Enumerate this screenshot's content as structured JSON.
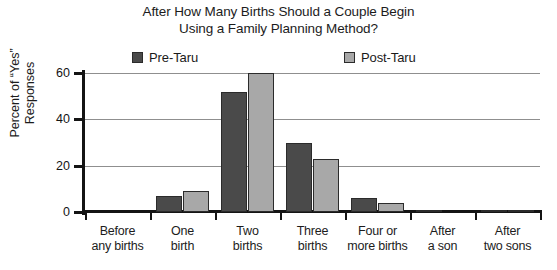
{
  "chart_data": {
    "type": "bar",
    "title": "After How Many Births Should a Couple Begin Using a Family Planning Method?",
    "title_lines": [
      "After How Many Births Should a Couple Begin",
      "Using a Family Planning Method?"
    ],
    "xlabel": "",
    "ylabel": "Percent of “Yes” Responses",
    "ylabel_lines": [
      "Percent of “Yes”",
      "Responses"
    ],
    "categories": [
      "Before any births",
      "One birth",
      "Two births",
      "Three births",
      "Four or more births",
      "After a son",
      "After two sons"
    ],
    "category_lines": [
      [
        "Before",
        "any births"
      ],
      [
        "One",
        "birth"
      ],
      [
        "Two",
        "births"
      ],
      [
        "Three",
        "births"
      ],
      [
        "Four or",
        "more births"
      ],
      [
        "After",
        "a son"
      ],
      [
        "After",
        "two sons"
      ]
    ],
    "series": [
      {
        "name": "Pre-Taru",
        "color": "#4a4a4a",
        "values": [
          0,
          7,
          52,
          30,
          6,
          0.5,
          0.5
        ]
      },
      {
        "name": "Post-Taru",
        "color": "#a8a8a8",
        "values": [
          0,
          9,
          60,
          23,
          4,
          0,
          0.5
        ]
      }
    ],
    "ylim": [
      0,
      60
    ],
    "yticks": [
      0,
      20,
      40,
      60
    ],
    "ytick_labels": [
      "0",
      "20",
      "40",
      "60"
    ],
    "grid": true,
    "legend_position": "top",
    "axis_color": "#141414",
    "grid_color": "#8f8f8f",
    "bar_edge_color": "#2b2b2b",
    "background": "#ffffff"
  }
}
